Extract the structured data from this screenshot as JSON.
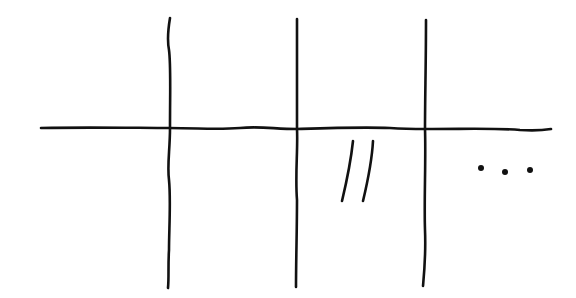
{
  "canvas": {
    "width": 576,
    "height": 298,
    "background": "#ffffff",
    "ink_color": "#111111"
  },
  "sketch": {
    "description": "Hand-drawn grid: one horizontal line crossed by three vertical lines, forming a 4-column by 2-row table-like layout",
    "horizontal_lines": [
      {
        "id": "h1",
        "path": "M41,128 C90,127 140,128 169,128 C200,128 215,130 240,128 C260,126 275,129 297,129 C330,128 360,127 390,128 C405,129 415,129 426,129 C470,129 500,128 520,130 C535,131 545,130 551,129"
      }
    ],
    "vertical_lines": [
      {
        "id": "v1",
        "path": "M170,18 C168,30 167,40 169,50 C171,65 170,90 170,128 C170,150 167,165 169,180 C171,200 169,230 169,250 C168,265 169,278 168,288"
      },
      {
        "id": "v2",
        "path": "M297,19 C297,50 297,90 297,129 C298,150 295,175 297,200 C297,230 296,260 296,287"
      },
      {
        "id": "v3",
        "path": "M426,20 C426,60 425,100 425,129 C426,160 424,200 425,230 C426,255 424,275 423,286"
      }
    ],
    "cells": [
      {
        "row": 1,
        "col": 1,
        "content": ""
      },
      {
        "row": 1,
        "col": 2,
        "content": ""
      },
      {
        "row": 1,
        "col": 3,
        "content": ""
      },
      {
        "row": 1,
        "col": 4,
        "content": ""
      },
      {
        "row": 2,
        "col": 1,
        "content": ""
      },
      {
        "row": 2,
        "col": 2,
        "content": ""
      },
      {
        "row": 2,
        "col": 3,
        "content": "//",
        "marks": [
          {
            "id": "slash-1",
            "path": "M353,141 C351,160 347,180 342,201"
          },
          {
            "id": "slash-2",
            "path": "M373,141 C372,160 368,180 363,201"
          }
        ]
      },
      {
        "row": 2,
        "col": 4,
        "content": "...",
        "dots": [
          {
            "id": "dot-1",
            "cx": 481,
            "cy": 168,
            "r": 3
          },
          {
            "id": "dot-2",
            "cx": 505,
            "cy": 172,
            "r": 3
          },
          {
            "id": "dot-3",
            "cx": 530,
            "cy": 170,
            "r": 3
          }
        ]
      }
    ],
    "stroke_width": 2.6
  }
}
